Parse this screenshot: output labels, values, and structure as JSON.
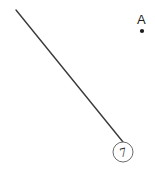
{
  "figure": {
    "background_color": "#ffffff",
    "ink_color": "#2f2f2f",
    "width": 155,
    "height": 172
  },
  "line": {
    "name": "leader-line",
    "x1": 16,
    "y1": 10,
    "x2": 123,
    "y2": 142,
    "stroke_color": "#3a3a3a",
    "stroke_width": 1.4
  },
  "callout": {
    "number": "7",
    "center_x": 123,
    "center_y": 152,
    "radius": 10,
    "stroke_color": "#6b6b6b",
    "text_color": "#2b2b2b"
  },
  "point": {
    "label": "A",
    "label_x": 137,
    "label_y": 13,
    "marker_x": 142,
    "marker_y": 31,
    "marker_radius": 2.1,
    "marker_color": "#1c1c1c"
  }
}
